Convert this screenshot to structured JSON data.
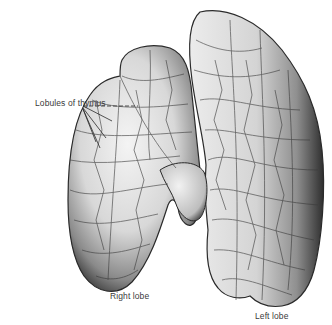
{
  "figure": {
    "labels": {
      "lobules": "Lobules of thymus",
      "right_lobe": "Right lobe",
      "left_lobe": "Left lobe"
    },
    "colors": {
      "background": "#ffffff",
      "tissue_light": "#eeeeee",
      "tissue_mid": "#b0b0b0",
      "tissue_dark": "#3a3a3a",
      "label_text": "#3a3a3a"
    }
  }
}
